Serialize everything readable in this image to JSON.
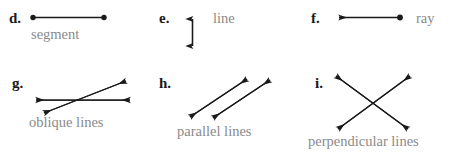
{
  "page": {
    "background_color": "#ffffff",
    "ink_color": "#1a1a1a",
    "caption_color": "#8a8a8a"
  },
  "items": [
    {
      "letter": "d.",
      "caption": "segment",
      "figure": "segment-with-two-endpoints"
    },
    {
      "letter": "e.",
      "caption": "line",
      "figure": "vertical-double-headed-arrow"
    },
    {
      "letter": "f.",
      "caption": "ray",
      "figure": "ray-arrow-left-with-endpoint-right"
    },
    {
      "letter": "g.",
      "caption": "oblique lines",
      "figure": "two-crossing-oblique-double-headed-arrows"
    },
    {
      "letter": "h.",
      "caption": "parallel lines",
      "figure": "two-parallel-diagonal-double-headed-arrows"
    },
    {
      "letter": "i.",
      "caption": "perpendicular lines",
      "figure": "two-crossing-perpendicular-double-headed-arrows"
    }
  ]
}
